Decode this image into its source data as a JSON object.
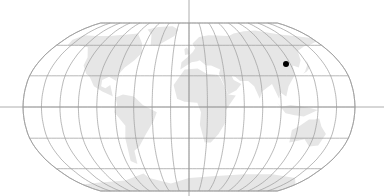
{
  "map": {
    "projection": "robinson",
    "colors": {
      "background": "#ffffff",
      "land": "#e6e6e6",
      "graticule": "#9a9a9a",
      "marker": "#000000"
    },
    "graticule": {
      "longitude_step_deg": 20,
      "latitude_step_deg": 30
    },
    "axes": {
      "horizontal_line": "equator",
      "vertical_line": "prime-meridian"
    },
    "markers": [
      {
        "label": "",
        "lon": 117,
        "lat": 40,
        "shape": "dot"
      }
    ]
  }
}
